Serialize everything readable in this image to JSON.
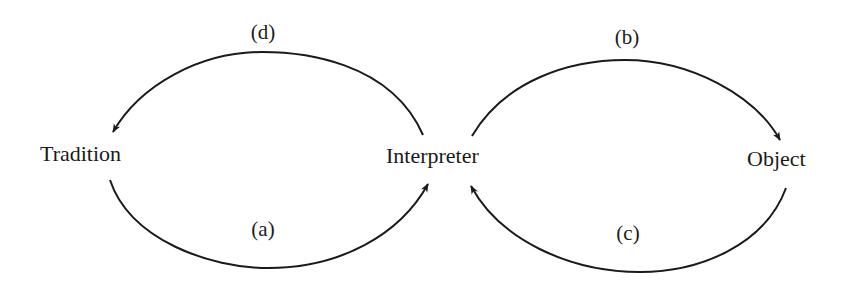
{
  "diagram": {
    "nodes": [
      {
        "id": "tradition",
        "label": "Tradition"
      },
      {
        "id": "interpreter",
        "label": "Interpreter"
      },
      {
        "id": "object",
        "label": "Object"
      }
    ],
    "edges": [
      {
        "id": "a",
        "label": "(a)",
        "from": "tradition",
        "to": "interpreter",
        "position": "bottom-left"
      },
      {
        "id": "b",
        "label": "(b)",
        "from": "interpreter",
        "to": "object",
        "position": "top-right"
      },
      {
        "id": "c",
        "label": "(c)",
        "from": "object",
        "to": "interpreter",
        "position": "bottom-right"
      },
      {
        "id": "d",
        "label": "(d)",
        "from": "interpreter",
        "to": "tradition",
        "position": "top-left"
      }
    ],
    "colors": {
      "stroke": "#1a1a1a",
      "background": "#ffffff"
    }
  }
}
